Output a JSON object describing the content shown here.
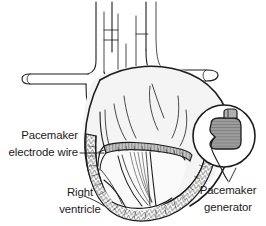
{
  "figure": {
    "type": "medical-line-illustration",
    "background_color": "#ffffff",
    "ink_color": "#1d1d1d",
    "heart_fill_color": "#f2f2f2",
    "device_fill_color": "#9a9a9a",
    "wire_fill_color": "#bdbdbd"
  },
  "labels": {
    "electrode_wire": {
      "line1": "Pacemaker",
      "line2": "electrode wire"
    },
    "right_ventricle": {
      "line1": "Right",
      "line2": "ventricle"
    },
    "generator": {
      "line1": "Pacemaker",
      "line2": "generator"
    }
  },
  "parts": {
    "great_vessels": "great-vessels",
    "heart_body": "heart-body",
    "right_ventricle_cavity": "right-ventricle-cavity",
    "myocardium_wall": "myocardium-wall",
    "valve_leaflets": "valve-leaflets",
    "electrode_wire": "electrode-wire",
    "generator_inset_circle": "generator-inset-circle",
    "generator_device": "pacemaker-generator-device",
    "generator_connector": "generator-connector-nub",
    "generator_lead": "generator-lead-hook"
  }
}
